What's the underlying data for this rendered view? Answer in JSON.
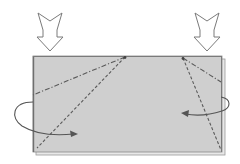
{
  "diagram": {
    "kind": "origami-fold-step",
    "colors": {
      "paper_fill": "#cfcfcf",
      "paper_edge": "#7a7a7a",
      "paper_back_layer": "#e6e6e6",
      "line": "#5a5a5a",
      "arrow_outline": "#777777",
      "background": "#ffffff"
    },
    "paper": {
      "x": 33,
      "y": 56,
      "width": 189,
      "height": 96
    },
    "push_arrows": [
      {
        "name": "left-push-arrow",
        "cx": 50,
        "top": 13,
        "bottom": 50
      },
      {
        "name": "right-push-arrow",
        "cx": 207,
        "top": 13,
        "bottom": 50
      }
    ],
    "fold_lines": [
      {
        "name": "left-mountain-fold",
        "style": "dash-dot",
        "x1": 125,
        "y1": 57,
        "x2": 33,
        "y2": 95
      },
      {
        "name": "left-valley-fold",
        "style": "dashed",
        "x1": 125,
        "y1": 57,
        "x2": 37,
        "y2": 148
      },
      {
        "name": "right-mountain-fold",
        "style": "dash-dot",
        "x1": 183,
        "y1": 58,
        "x2": 221,
        "y2": 82
      },
      {
        "name": "right-valley-fold",
        "style": "dashed",
        "x1": 183,
        "y1": 58,
        "x2": 221,
        "y2": 150
      }
    ],
    "curved_arrows": [
      {
        "name": "left-tuck-arrow",
        "direction": "inward-right"
      },
      {
        "name": "right-tuck-arrow",
        "direction": "inward-left"
      }
    ]
  }
}
